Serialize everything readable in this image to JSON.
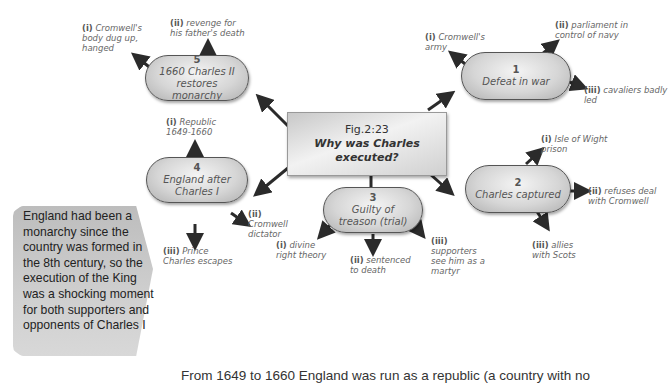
{
  "center": {
    "fig_label": "Fig.2:23",
    "question": "Why was Charles executed?"
  },
  "nodes": [
    {
      "number": "1",
      "title": "Defeat in war",
      "reasons": [
        {
          "marker": "(i)",
          "text": "Cromwell's army"
        },
        {
          "marker": "(ii)",
          "text": "parliament in control of navy"
        },
        {
          "marker": "(iii)",
          "text": "cavaliers badly led"
        }
      ]
    },
    {
      "number": "2",
      "title": "Charles captured",
      "reasons": [
        {
          "marker": "(i)",
          "text": "Isle of Wight prison"
        },
        {
          "marker": "(ii)",
          "text": "refuses deal with Cromwell"
        },
        {
          "marker": "(iii)",
          "text": "allies with Scots"
        }
      ]
    },
    {
      "number": "3",
      "title": "Guilty of treason (trial)",
      "reasons": [
        {
          "marker": "(i)",
          "text": "divine right theory"
        },
        {
          "marker": "(ii)",
          "text": "sentenced to death"
        },
        {
          "marker": "(iii)",
          "text": "supporters see him as a martyr"
        }
      ]
    },
    {
      "number": "4",
      "title": "England after Charles I",
      "reasons": [
        {
          "marker": "(i)",
          "text": "Republic 1649-1660"
        },
        {
          "marker": "(ii)",
          "text": "Cromwell dictator"
        },
        {
          "marker": "(iii)",
          "text": "Prince Charles escapes"
        }
      ]
    },
    {
      "number": "5",
      "title": "1660 Charles II restores monarchy",
      "reasons": [
        {
          "marker": "(i)",
          "text": "Cromwell's body dug up, hanged"
        },
        {
          "marker": "(ii)",
          "text": "revenge for his father's death"
        }
      ]
    }
  ],
  "callout": {
    "text": "England had been a monarchy since the country was formed in the 8th century, so the execution of the King was a shocking moment for both supporters and opponents of Charles I"
  },
  "footer": {
    "text": "From 1649 to 1660 England was run as a republic (a country with no"
  },
  "colors": {
    "arrow": "#2b2b2b",
    "pill_border": "#555555",
    "callout_bg": "#c8c8c8"
  }
}
